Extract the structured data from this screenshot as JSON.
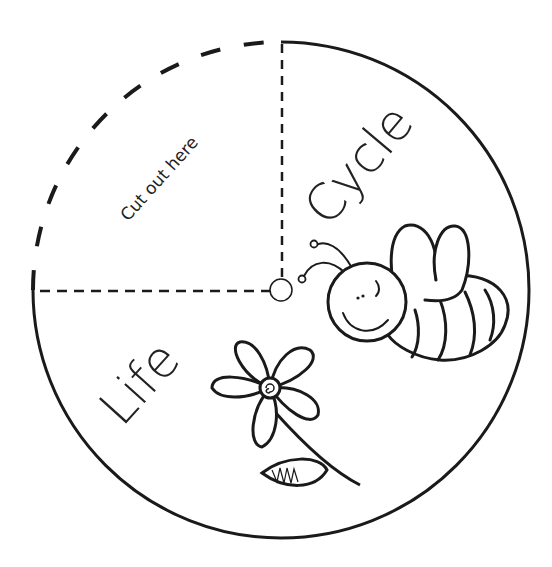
{
  "worksheet": {
    "title_word_1": "Life",
    "title_word_2": "Cycle",
    "cut_instruction": "Cut out here"
  },
  "colors": {
    "ink": "#1a1a1a",
    "background": "#ffffff"
  },
  "geometry": {
    "center": [
      281,
      290
    ],
    "radius": 248
  }
}
